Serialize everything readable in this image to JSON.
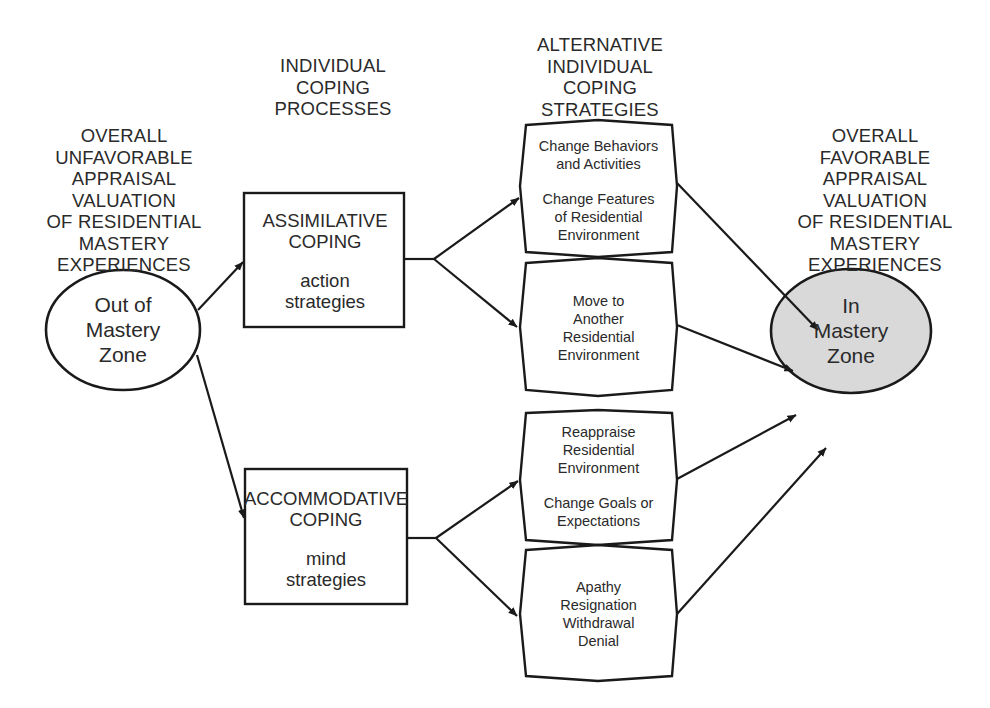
{
  "diagram": {
    "headings": {
      "left": [
        "OVERALL",
        "UNFAVORABLE",
        "APPRAISAL",
        "VALUATION",
        "OF RESIDENTIAL",
        "MASTERY",
        "EXPERIENCES"
      ],
      "processes": [
        "INDIVIDUAL",
        "COPING",
        "PROCESSES"
      ],
      "strategies": [
        "ALTERNATIVE",
        "INDIVIDUAL",
        "COPING",
        "STRATEGIES"
      ],
      "right": [
        "OVERALL",
        "FAVORABLE",
        "APPRAISAL",
        "VALUATION",
        "OF RESIDENTIAL",
        "MASTERY",
        "EXPERIENCES"
      ]
    },
    "nodes": {
      "out_of_mastery": {
        "lines": [
          "Out of",
          "Mastery",
          "Zone"
        ],
        "fill": "#ffffff"
      },
      "in_mastery": {
        "lines": [
          "In",
          "Mastery",
          "Zone"
        ],
        "fill": "#d9d9d9"
      },
      "assimilative": {
        "title": [
          "ASSIMILATIVE",
          "COPING"
        ],
        "subtitle": [
          "action",
          "strategies"
        ]
      },
      "accommodative": {
        "title": [
          "ACCOMMODATIVE",
          "COPING"
        ],
        "subtitle": [
          "mind",
          "strategies"
        ]
      },
      "strategy_1": {
        "groups": [
          [
            "Change Behaviors",
            "and Activities"
          ],
          [
            "Change Features",
            "of Residential",
            "Environment"
          ]
        ]
      },
      "strategy_2": {
        "groups": [
          [
            "Move to",
            "Another",
            "Residential",
            "Environment"
          ]
        ]
      },
      "strategy_3": {
        "groups": [
          [
            "Reappraise",
            "Residential",
            "Environment"
          ],
          [
            "Change Goals or",
            "Expectations"
          ]
        ]
      },
      "strategy_4": {
        "groups": [
          [
            "Apathy",
            "Resignation",
            "Withdrawal",
            "Denial"
          ]
        ]
      }
    },
    "edges": [
      {
        "from": "out_of_mastery",
        "to": "assimilative"
      },
      {
        "from": "out_of_mastery",
        "to": "accommodative"
      },
      {
        "from": "assimilative",
        "to": "strategy_1"
      },
      {
        "from": "assimilative",
        "to": "strategy_2"
      },
      {
        "from": "accommodative",
        "to": "strategy_3"
      },
      {
        "from": "accommodative",
        "to": "strategy_4"
      },
      {
        "from": "strategy_1",
        "to": "in_mastery"
      },
      {
        "from": "strategy_2",
        "to": "in_mastery"
      },
      {
        "from": "strategy_3",
        "to": "in_mastery"
      },
      {
        "from": "strategy_4",
        "to": "in_mastery"
      }
    ],
    "colors": {
      "stroke": "#1a1a1a",
      "text": "#2a2a2a",
      "goal_fill": "#d9d9d9",
      "background": "#ffffff"
    }
  }
}
